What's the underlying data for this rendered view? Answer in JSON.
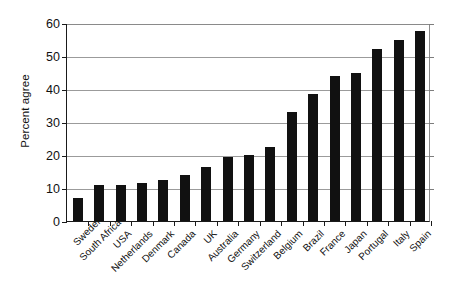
{
  "chart_data": {
    "type": "bar",
    "title": "",
    "subtitle": "",
    "xlabel": "",
    "ylabel": "Percent agree",
    "ylim": [
      0,
      60
    ],
    "yticks": [
      0,
      10,
      20,
      30,
      40,
      50,
      60
    ],
    "ytick_labels": [
      "0",
      "10",
      "20",
      "30",
      "40",
      "50",
      "60"
    ],
    "grid": true,
    "legend": null,
    "bar_color": "#111111",
    "categories": [
      "Sweden",
      "South Africa",
      "USA",
      "Netherlands",
      "Denmark",
      "Canada",
      "UK",
      "Australia",
      "Germany",
      "Switzerland",
      "Belgium",
      "Brazil",
      "France",
      "Japan",
      "Portugal",
      "Italy",
      "Spain"
    ],
    "values": [
      7,
      11,
      11,
      11.5,
      12.5,
      14,
      16.5,
      19.5,
      20,
      22.5,
      33,
      38.5,
      44,
      45,
      52,
      55,
      57.5
    ]
  },
  "axis": {
    "y_title": "Percent agree"
  }
}
